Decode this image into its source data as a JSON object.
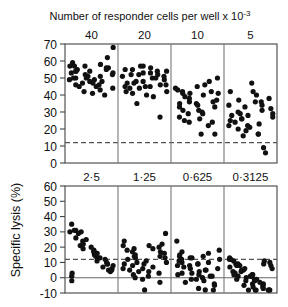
{
  "figure": {
    "title": "Number of responder cells per well  x 10",
    "title_exponent": "-3",
    "y_axis_label": "Specific lysis (%)",
    "colors": {
      "axis": "#444444",
      "divider": "#777777",
      "dot": "#111111",
      "dashed_threshold": "#555555",
      "zero_line": "#666666",
      "background": "#ffffff"
    }
  },
  "chart_data": {
    "type": "scatter",
    "xlabel": "Number of responder cells per well x 10^-3",
    "ylabel": "Specific lysis (%)",
    "grid": false,
    "legend": "none",
    "panels": [
      {
        "name": "top-panel",
        "ylim": [
          0,
          70
        ],
        "yticks": [
          0,
          10,
          20,
          30,
          40,
          50,
          60,
          70
        ],
        "threshold_line": {
          "value": 12,
          "style": "dashed"
        },
        "groups": [
          {
            "label": "40",
            "values": [
              59,
              55,
              52,
              49,
              46,
              40,
              68,
              57,
              54,
              51,
              48,
              45,
              62,
              56,
              53,
              50,
              47,
              41,
              58,
              55,
              52,
              49,
              45,
              57,
              54,
              51,
              48,
              44,
              57,
              54,
              50,
              47,
              43,
              56,
              53,
              50,
              46,
              42
            ]
          },
          {
            "label": "20",
            "values": [
              55,
              52,
              48,
              45,
              39,
              54,
              51,
              47,
              44,
              35,
              57,
              53,
              50,
              46,
              42,
              55,
              52,
              48,
              45,
              27,
              54,
              51,
              47,
              44,
              40,
              56,
              52,
              49,
              45,
              41,
              57,
              53,
              50,
              46,
              42
            ]
          },
          {
            "label": "10",
            "values": [
              43,
              39,
              29,
              26,
              17,
              48,
              41,
              35,
              31,
              24,
              45,
              40,
              36,
              33,
              27,
              42,
              38,
              34,
              30,
              22,
              50,
              44,
              41,
              36,
              31,
              46,
              42,
              37,
              33,
              25,
              41,
              35,
              29,
              24,
              17
            ]
          },
          {
            "label": "5",
            "values": [
              42,
              37,
              33,
              28,
              23,
              9,
              38,
              34,
              30,
              26,
              21,
              17,
              36,
              32,
              28,
              24,
              19,
              47,
              40,
              34,
              29,
              25,
              20,
              16,
              42,
              36,
              31,
              27,
              22,
              29,
              26,
              22,
              17,
              6
            ]
          }
        ]
      },
      {
        "name": "bottom-panel",
        "ylim": [
          -10,
          60
        ],
        "yticks": [
          -10,
          0,
          10,
          20,
          30,
          40,
          50,
          60
        ],
        "threshold_line": {
          "value": 12,
          "style": "dashed"
        },
        "zero_line": {
          "value": 0,
          "style": "solid"
        },
        "groups": [
          {
            "label": "2·5",
            "values": [
              35,
              21,
              19,
              15,
              11,
              7,
              4,
              30,
              26,
              22,
              17,
              13,
              9,
              5,
              31,
              29,
              24,
              18,
              14,
              10,
              6,
              -2,
              30,
              25,
              20,
              16,
              12,
              8,
              3,
              31,
              22,
              17,
              13,
              9,
              5,
              1
            ]
          },
          {
            "label": "1·25",
            "values": [
              24,
              19,
              15,
              11,
              7,
              3,
              29,
              21,
              17,
              13,
              9,
              4,
              -3,
              22,
              18,
              14,
              10,
              6,
              1,
              20,
              16,
              12,
              8,
              4,
              -1,
              21,
              17,
              13,
              9,
              5,
              0,
              -8,
              19,
              14,
              10,
              6,
              2
            ]
          },
          {
            "label": "0·625",
            "values": [
              24,
              17,
              13,
              9,
              5,
              1,
              -4,
              15,
              12,
              8,
              4,
              0,
              -9,
              18,
              14,
              10,
              6,
              2,
              -2,
              16,
              12,
              8,
              3,
              -1,
              -7,
              14,
              10,
              6,
              2,
              -3,
              13,
              9,
              5,
              1,
              -5,
              11,
              7,
              3,
              -1,
              -8
            ]
          },
          {
            "label": "0·3125",
            "values": [
              12,
              9,
              5,
              2,
              -1,
              -5,
              -9,
              11,
              8,
              4,
              1,
              -2,
              -6,
              -10,
              13,
              9,
              6,
              2,
              -1,
              -4,
              -8,
              12,
              8,
              5,
              1,
              -3,
              -7,
              10,
              7,
              3,
              0,
              -4,
              -9,
              11,
              8,
              4,
              1,
              -2,
              -6,
              -10,
              9,
              6,
              2,
              -1,
              -5,
              -9
            ]
          }
        ]
      }
    ]
  }
}
